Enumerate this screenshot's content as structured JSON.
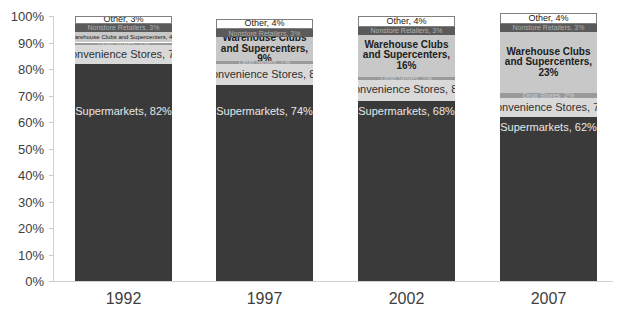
{
  "chart_data": {
    "type": "bar",
    "stacked": true,
    "title": "",
    "xlabel": "",
    "ylabel": "",
    "ylim": [
      0,
      100
    ],
    "y_ticks": [
      "0%",
      "10%",
      "20%",
      "30%",
      "40%",
      "50%",
      "60%",
      "70%",
      "80%",
      "90%",
      "100%"
    ],
    "grid": false,
    "legend": "none (data labels inside segments)",
    "categories": [
      "1992",
      "1997",
      "2002",
      "2007"
    ],
    "series": [
      {
        "name": "Supermarkets",
        "color": "#3a3a3a",
        "values": [
          82,
          74,
          68,
          62
        ]
      },
      {
        "name": "Convenience Stores",
        "color": "#d9d9d9",
        "values": [
          7,
          8,
          8,
          7
        ]
      },
      {
        "name": "Drug Stores",
        "color": "#9a9a9a",
        "values": [
          1,
          1,
          1,
          2
        ]
      },
      {
        "name": "Warehouse Clubs and Supercenters",
        "color": "#c8c8c8",
        "values": [
          4,
          9,
          16,
          23
        ]
      },
      {
        "name": "Nonstore Retailers",
        "color": "#5a5a5a",
        "values": [
          3,
          3,
          3,
          3
        ]
      },
      {
        "name": "Other",
        "color": "#ffffff",
        "values": [
          3,
          4,
          4,
          4
        ]
      }
    ],
    "bars": [
      {
        "category": "1992",
        "segments": [
          {
            "label": "Supermarkets, 82%",
            "value": 82
          },
          {
            "label": "Convenience Stores, 7%",
            "value": 7
          },
          {
            "label": "Drug Stores, 1%",
            "value": 1
          },
          {
            "label": "Warehouse Clubs and Supercenters, 4%",
            "value": 4
          },
          {
            "label": "Nonstore Retailers, 3%",
            "value": 3
          },
          {
            "label": "Other, 3%",
            "value": 3
          }
        ]
      },
      {
        "category": "1997",
        "segments": [
          {
            "label": "Supermarkets, 74%",
            "value": 74
          },
          {
            "label": "Convenience Stores, 8%",
            "value": 8
          },
          {
            "label": "Drug Stores, 1%",
            "value": 1
          },
          {
            "label": "Warehouse Clubs and Supercenters, 9%",
            "value": 9
          },
          {
            "label": "Nonstore Retailers, 3%",
            "value": 3
          },
          {
            "label": "Other, 4%",
            "value": 4
          }
        ]
      },
      {
        "category": "2002",
        "segments": [
          {
            "label": "Supermarkets, 68%",
            "value": 68
          },
          {
            "label": "Convenience Stores, 8%",
            "value": 8
          },
          {
            "label": "Drug Stores, 1%",
            "value": 1
          },
          {
            "label": "Warehouse Clubs and Supercenters, 16%",
            "value": 16
          },
          {
            "label": "Nonstore Retailers, 3%",
            "value": 3
          },
          {
            "label": "Other, 4%",
            "value": 4
          }
        ]
      },
      {
        "category": "2007",
        "segments": [
          {
            "label": "Supermarkets, 62%",
            "value": 62
          },
          {
            "label": "Convenience Stores, 7%",
            "value": 7
          },
          {
            "label": "Drug Stores, 2%",
            "value": 2
          },
          {
            "label": "Warehouse Clubs and Supercenters, 23%",
            "value": 23
          },
          {
            "label": "Nonstore Retailers, 3%",
            "value": 3
          },
          {
            "label": "Other, 4%",
            "value": 4
          }
        ]
      }
    ]
  }
}
